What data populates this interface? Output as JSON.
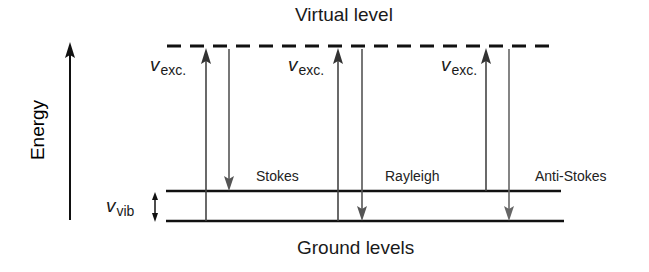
{
  "diagram": {
    "type": "energy-level-diagram",
    "axis": {
      "label": "Energy",
      "direction": "up"
    },
    "levels": {
      "virtual": {
        "label": "Virtual level",
        "style": "dashed"
      },
      "ground": {
        "label": "Ground levels",
        "style": "solid",
        "count": 2
      }
    },
    "vib_gap": {
      "symbol": "v",
      "subscript": "vib"
    },
    "processes": [
      {
        "name": "Stokes",
        "excitation": {
          "symbol": "v",
          "subscript": "exc."
        },
        "from": "ground-lower",
        "to_after": "ground-upper"
      },
      {
        "name": "Rayleigh",
        "excitation": {
          "symbol": "v",
          "subscript": "exc."
        },
        "from": "ground-lower",
        "to_after": "ground-lower"
      },
      {
        "name": "Anti-Stokes",
        "excitation": {
          "symbol": "v",
          "subscript": "exc."
        },
        "from": "ground-upper",
        "to_after": "ground-lower"
      }
    ],
    "colors": {
      "line": "#111111",
      "arrow_up": "#333333",
      "arrow_down": "#555555",
      "background": "#ffffff"
    }
  }
}
